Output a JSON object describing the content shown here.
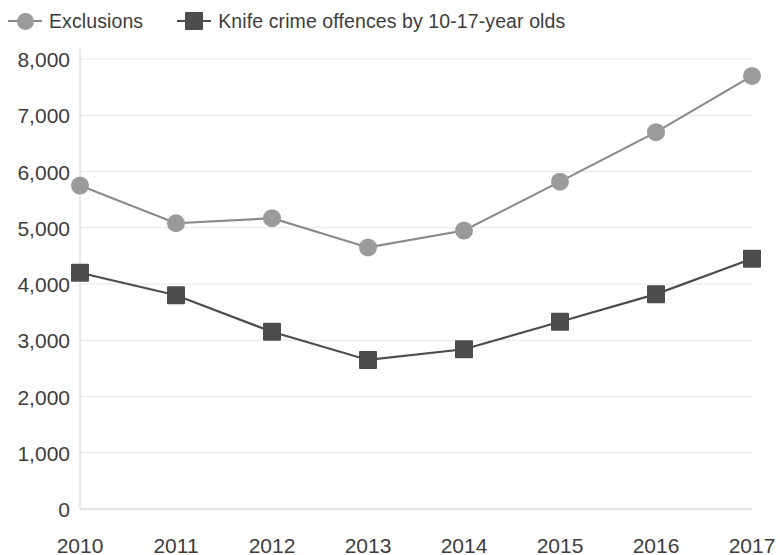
{
  "legend": {
    "position": "top-left",
    "entries": [
      {
        "label": "Exclusions",
        "marker": "circle-marker",
        "color": "#9a9a9a",
        "line_color": "#8a8a8a"
      },
      {
        "label": "Knife crime offences by 10-17-year olds",
        "marker": "square-marker",
        "color": "#4d4d4d",
        "line_color": "#4c4c4c"
      }
    ]
  },
  "axes": {
    "y_ticks": [
      "8,000",
      "7,000",
      "6,000",
      "5,000",
      "4,000",
      "3,000",
      "2,000",
      "1,000",
      "0"
    ],
    "y_tick_values": [
      8000,
      7000,
      6000,
      5000,
      4000,
      3000,
      2000,
      1000,
      0
    ],
    "x_ticks": [
      "2010",
      "2011",
      "2012",
      "2013",
      "2014",
      "2015",
      "2016",
      "2017"
    ],
    "xlabel": "",
    "ylabel": ""
  },
  "chart_data": {
    "type": "line",
    "title": "",
    "subtitle": "",
    "xlabel": "",
    "ylabel": "",
    "categories": [
      "2010",
      "2011",
      "2012",
      "2013",
      "2014",
      "2015",
      "2016",
      "2017"
    ],
    "x": [
      2010,
      2011,
      2012,
      2013,
      2014,
      2015,
      2016,
      2017
    ],
    "ylim": [
      0,
      8000
    ],
    "ytick_step": 1000,
    "grid": "horizontal-light",
    "legend_position": "top-left",
    "series": [
      {
        "name": "Exclusions",
        "marker": "circle",
        "color": "#9a9a9a",
        "line_color": "#8a8a8a",
        "values": [
          5750,
          5080,
          5170,
          4650,
          4950,
          5820,
          6700,
          7700
        ]
      },
      {
        "name": "Knife crime offences by 10-17-year olds",
        "marker": "square",
        "color": "#4d4d4d",
        "line_color": "#4c4c4c",
        "values": [
          4200,
          3800,
          3150,
          2650,
          2840,
          3330,
          3820,
          4450
        ]
      }
    ],
    "annotations": []
  },
  "colors": {
    "background": "#ffffff",
    "text": "#3d3d3d",
    "axis_line": "#d0d0d0",
    "gridline": "#e8e8e8"
  }
}
